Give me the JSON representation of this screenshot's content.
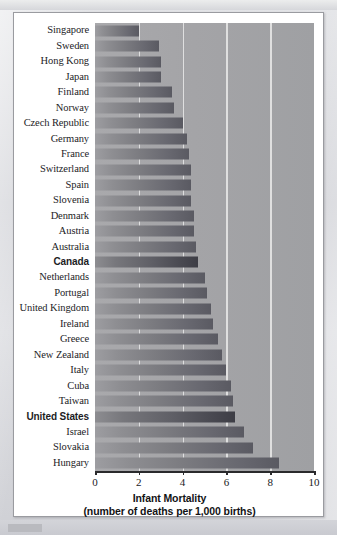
{
  "chart_data": {
    "type": "bar",
    "orientation": "horizontal",
    "title": "",
    "xlabel": "Infant Mortality",
    "xlabel_sub": "(number of deaths per 1,000 births)",
    "ylabel": "",
    "xlim": [
      0,
      10
    ],
    "xticks": [
      0,
      2,
      4,
      6,
      8,
      10
    ],
    "xtick_labels": [
      "0",
      "2",
      "4",
      "6",
      "8",
      "10"
    ],
    "grid": true,
    "grid_axis": "x",
    "legend": "none",
    "highlight_color": "#3d3d45",
    "bar_color": "#7b7b80",
    "plot_background": "#a4a4a7",
    "categories": [
      "Singapore",
      "Sweden",
      "Hong Kong",
      "Japan",
      "Finland",
      "Norway",
      "Czech Republic",
      "Germany",
      "France",
      "Switzerland",
      "Spain",
      "Slovenia",
      "Denmark",
      "Austria",
      "Australia",
      "Canada",
      "Netherlands",
      "Portugal",
      "United Kingdom",
      "Ireland",
      "Greece",
      "New Zealand",
      "Italy",
      "Cuba",
      "Taiwan",
      "United States",
      "Israel",
      "Slovakia",
      "Hungary"
    ],
    "values": [
      2.0,
      2.9,
      3.0,
      3.0,
      3.5,
      3.6,
      4.0,
      4.2,
      4.3,
      4.4,
      4.4,
      4.4,
      4.5,
      4.5,
      4.6,
      4.7,
      5.0,
      5.1,
      5.3,
      5.4,
      5.6,
      5.8,
      6.0,
      6.2,
      6.3,
      6.4,
      6.8,
      7.2,
      8.4
    ],
    "highlighted": [
      "Canada",
      "United States"
    ]
  }
}
